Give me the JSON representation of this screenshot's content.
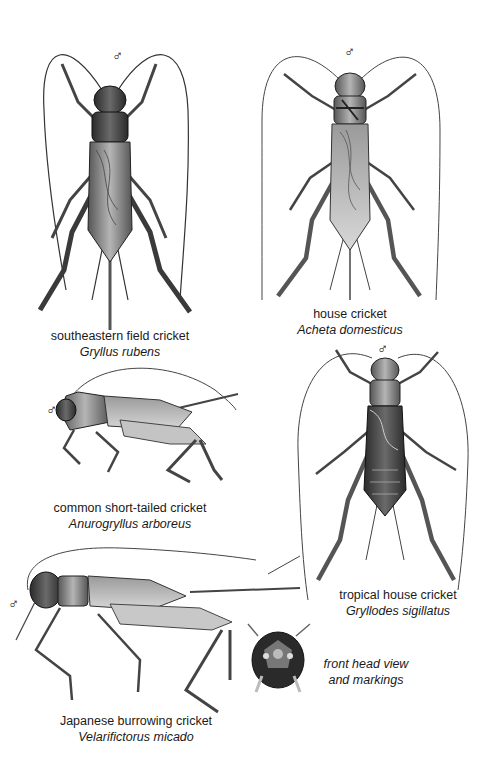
{
  "plate": {
    "background": "#ffffff",
    "sex_symbol": "♂",
    "specimens": [
      {
        "id": "gryllus-rubens",
        "common_name": "southeastern field cricket",
        "scientific_name": "Gryllus rubens",
        "sex": "♂",
        "view": "dorsal"
      },
      {
        "id": "acheta-domesticus",
        "common_name": "house cricket",
        "scientific_name": "Acheta domesticus",
        "sex": "♂",
        "view": "dorsal"
      },
      {
        "id": "anurogryllus-arboreus",
        "common_name": "common short-tailed cricket",
        "scientific_name": "Anurogryllus arboreus",
        "sex": "♂",
        "view": "lateral"
      },
      {
        "id": "gryllodes-sigillatus",
        "common_name": "tropical house cricket",
        "scientific_name": "Gryllodes sigillatus",
        "sex": "♂",
        "view": "dorsal"
      },
      {
        "id": "velarifictorus-micado",
        "common_name": "Japanese burrowing cricket",
        "scientific_name": "Velarifictorus micado",
        "sex": "♂",
        "view": "lateral"
      }
    ],
    "inset": {
      "caption_line1": "front head view",
      "caption_line2": "and markings"
    }
  }
}
